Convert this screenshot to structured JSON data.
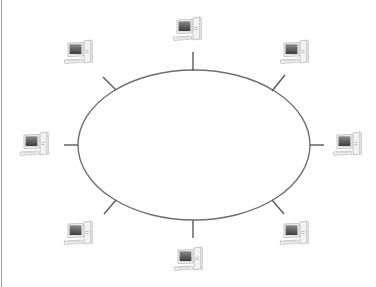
{
  "diagram": {
    "type": "ring-network-topology",
    "colors": {
      "ring": "#6e6e6e",
      "spoke": "#5a5a5a",
      "border": "#9a9a9a",
      "screen_dark": "#3c3c3c",
      "screen_light": "#8a8a8a",
      "case": "#f2f2f2",
      "outline": "#b8b8b8"
    },
    "ring": {
      "cx": 194,
      "cy": 145,
      "rx": 116,
      "ry": 75
    },
    "nodes": [
      {
        "id": "top",
        "icon": "desktop-computer-icon",
        "x": 171,
        "y": 15,
        "spoke": [
          193,
          52,
          193,
          71
        ]
      },
      {
        "id": "upper-right",
        "icon": "desktop-computer-icon",
        "x": 278,
        "y": 38,
        "spoke": [
          285,
          75,
          272,
          91
        ]
      },
      {
        "id": "right",
        "icon": "desktop-computer-icon",
        "x": 331,
        "y": 130,
        "spoke": [
          310,
          145,
          324,
          145
        ]
      },
      {
        "id": "lower-right",
        "icon": "desktop-computer-icon",
        "x": 278,
        "y": 219,
        "spoke": [
          272,
          200,
          284,
          214
        ]
      },
      {
        "id": "bottom",
        "icon": "desktop-computer-icon",
        "x": 172,
        "y": 245,
        "spoke": [
          193,
          220,
          193,
          238
        ]
      },
      {
        "id": "lower-left",
        "icon": "desktop-computer-icon",
        "x": 62,
        "y": 219,
        "spoke": [
          116,
          200,
          104,
          214
        ]
      },
      {
        "id": "left",
        "icon": "desktop-computer-icon",
        "x": 18,
        "y": 130,
        "spoke": [
          64,
          145,
          78,
          145
        ]
      },
      {
        "id": "upper-left",
        "icon": "desktop-computer-icon",
        "x": 62,
        "y": 38,
        "spoke": [
          103,
          77,
          116,
          90
        ]
      }
    ]
  }
}
